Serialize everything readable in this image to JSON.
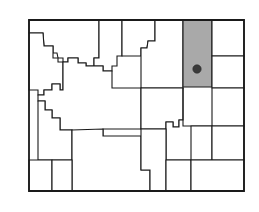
{
  "figure": {
    "kind": "county-locator-map",
    "state_name": "Wyoming",
    "title": "",
    "caption": "",
    "background_color": "#ffffff",
    "county_fill_color": "#ffffff",
    "county_border_color": "#1a1a1a",
    "highlight_fill_color": "#a9a9a9",
    "state_outline_color": "#1a1a1a",
    "marker_color": "#3a3a3a"
  },
  "map": {
    "bounds": {
      "left": 28,
      "top": 19,
      "right": 245,
      "bottom": 192
    },
    "highlighted_county": {
      "name": "Campbell",
      "fill": "#a9a9a9",
      "bounds": {
        "left": 183,
        "top": 20,
        "right": 212,
        "bottom": 87
      }
    },
    "marker": {
      "name": "county-seat-marker",
      "x": 197,
      "y": 69,
      "radius": 4.2,
      "color": "#3a3a3a"
    },
    "counties": [
      {
        "id": "park",
        "name": "Park",
        "highlighted": false,
        "points": "29,20 29,33 43,33 44,46 53,46 53,53 57,53 58,58 63,58 63,62 68,62 68,58 78,58 78,63 86,63 86,66 94,66 94,58 99,58 99,20"
      },
      {
        "id": "bighorn",
        "name": "Big Horn",
        "highlighted": false,
        "points": "99,20 99,58 94,58 94,66 103,66 103,71 112,71 112,66 117,66 117,56 122,56 122,20"
      },
      {
        "id": "sheridan",
        "name": "Sheridan",
        "highlighted": false,
        "points": "122,20 122,56 141,56 141,48 147,48 148,41 155,41 155,20"
      },
      {
        "id": "johnson-n",
        "name": "Campbell-W",
        "highlighted": false,
        "points": "155,20 155,41 148,41 147,48 141,48 141,56 141,88 183,88 183,20"
      },
      {
        "id": "campbell",
        "name": "Campbell",
        "highlighted": true,
        "points": "183,20 212,20 212,87 183,87"
      },
      {
        "id": "crook",
        "name": "Crook",
        "highlighted": false,
        "points": "212,20 244,20 244,56 212,56"
      },
      {
        "id": "weston",
        "name": "Weston",
        "highlighted": false,
        "points": "212,56 244,56 244,88 212,88"
      },
      {
        "id": "teton",
        "name": "Teton",
        "highlighted": false,
        "points": "29,33 29,90 38,90 38,95 44,95 44,90 52,90 52,84 60,84 60,90 63,90 63,62 58,62 58,58 53,58 53,46 44,46 43,33"
      },
      {
        "id": "fremont",
        "name": "Fremont",
        "highlighted": false,
        "points": "63,62 63,90 60,90 60,84 52,84 52,90 44,90 44,95 38,95 38,101 45,101 45,110 52,110 52,118 60,118 60,130 72,130 72,136 103,136 103,129 141,129 141,88 112,88 112,71 103,71 103,66 94,66 86,66 86,63 78,63 78,58 68,58 68,62"
      },
      {
        "id": "natrona",
        "name": "Natrona",
        "highlighted": false,
        "points": "141,88 141,129 166,129 166,122 173,122 173,127 179,127 179,120 183,120 183,88"
      },
      {
        "id": "converse",
        "name": "Converse",
        "highlighted": false,
        "points": "183,88 183,120 179,120 179,127 173,127 173,122 166,122 166,129 166,160 212,160 212,126 183,126"
      },
      {
        "id": "niobrara",
        "name": "Niobrara",
        "highlighted": false,
        "points": "212,88 244,88 244,126 212,126"
      },
      {
        "id": "lincoln-n",
        "name": "Lincoln",
        "highlighted": false,
        "points": "38,101 38,160 72,160 72,136 72,130 60,130 60,118 52,118 52,110 45,110 45,101"
      },
      {
        "id": "sweetwater",
        "name": "Sweetwater",
        "highlighted": false,
        "points": "72,136 72,160 72,191 150,191 150,170 141,170 141,160 141,136 103,136 103,129 72,130"
      },
      {
        "id": "uinta",
        "name": "Uinta",
        "highlighted": false,
        "points": "29,160 52,160 52,191 29,191"
      },
      {
        "id": "lincoln-s",
        "name": "Lincoln-S",
        "highlighted": false,
        "points": "52,160 72,160 72,191 52,191"
      },
      {
        "id": "carbon",
        "name": "Carbon",
        "highlighted": false,
        "points": "141,136 141,160 141,170 150,170 150,191 166,191 166,160 166,129 141,129"
      },
      {
        "id": "albany",
        "name": "Albany",
        "highlighted": false,
        "points": "166,160 166,191 191,191 191,160"
      },
      {
        "id": "platte",
        "name": "Platte",
        "highlighted": false,
        "points": "191,160 212,160 212,126 191,126"
      },
      {
        "id": "goshen",
        "name": "Goshen",
        "highlighted": false,
        "points": "212,126 244,126 244,160 212,160"
      },
      {
        "id": "laramie",
        "name": "Laramie",
        "highlighted": false,
        "points": "191,160 244,160 244,191 191,191"
      }
    ],
    "state_outline": "29,20 244,20 244,191 29,191 29,20"
  }
}
